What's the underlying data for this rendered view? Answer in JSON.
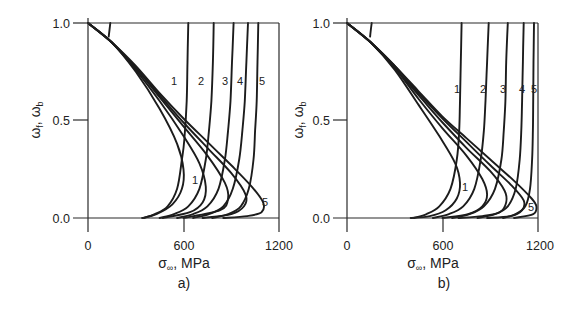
{
  "chart_data": [
    {
      "type": "line",
      "panel_label": "a)",
      "xlabel": "σ∞ , MPa",
      "xlabel_symbol": "σ",
      "xlabel_subscript": "∞",
      "xlabel_unit": ", MPa",
      "ylabel": "ωf , ωb",
      "ylabel_symbol_1": "ω",
      "ylabel_sub_1": "f",
      "ylabel_symbol_2": "ω",
      "ylabel_sub_2": "b",
      "xlim": [
        0,
        1200
      ],
      "ylim": [
        0.0,
        1.0
      ],
      "xticks": [
        "0",
        "600",
        "1200"
      ],
      "yticks": [
        "0.0",
        "0.5",
        "1.0"
      ],
      "grid": false,
      "legend": "none (curves numbered 1–5 inline)",
      "curve_labels_top": [
        "1",
        "2",
        "3",
        "4",
        "5"
      ],
      "curve_labels_bottom": [
        "1",
        "5"
      ],
      "series": [
        {
          "name": "1 (ωf branch)",
          "points": [
            [
              0,
              1.0
            ],
            [
              150,
              0.9
            ],
            [
              300,
              0.75
            ],
            [
              450,
              0.56
            ],
            [
              560,
              0.38
            ],
            [
              600,
              0.25
            ],
            [
              590,
              0.15
            ],
            [
              530,
              0.07
            ],
            [
              430,
              0.02
            ],
            [
              340,
              0.0
            ]
          ]
        },
        {
          "name": "2 (ωf branch)",
          "points": [
            [
              0,
              1.0
            ],
            [
              150,
              0.9
            ],
            [
              300,
              0.76
            ],
            [
              450,
              0.6
            ],
            [
              600,
              0.42
            ],
            [
              700,
              0.28
            ],
            [
              740,
              0.16
            ],
            [
              720,
              0.08
            ],
            [
              640,
              0.03
            ],
            [
              470,
              0.0
            ]
          ]
        },
        {
          "name": "3 (ωf branch)",
          "points": [
            [
              0,
              1.0
            ],
            [
              150,
              0.9
            ],
            [
              300,
              0.77
            ],
            [
              450,
              0.62
            ],
            [
              600,
              0.47
            ],
            [
              750,
              0.32
            ],
            [
              860,
              0.18
            ],
            [
              880,
              0.1
            ],
            [
              830,
              0.04
            ],
            [
              600,
              0.0
            ]
          ]
        },
        {
          "name": "4 (ωf branch)",
          "points": [
            [
              0,
              1.0
            ],
            [
              150,
              0.9
            ],
            [
              300,
              0.77
            ],
            [
              450,
              0.63
            ],
            [
              600,
              0.49
            ],
            [
              750,
              0.36
            ],
            [
              900,
              0.23
            ],
            [
              990,
              0.12
            ],
            [
              980,
              0.06
            ],
            [
              900,
              0.02
            ],
            [
              720,
              0.0
            ]
          ]
        },
        {
          "name": "5 (ωf branch)",
          "points": [
            [
              0,
              1.0
            ],
            [
              150,
              0.9
            ],
            [
              300,
              0.78
            ],
            [
              450,
              0.64
            ],
            [
              600,
              0.51
            ],
            [
              750,
              0.39
            ],
            [
              900,
              0.27
            ],
            [
              1030,
              0.16
            ],
            [
              1100,
              0.08
            ],
            [
              1090,
              0.03
            ],
            [
              1000,
              0.01
            ],
            [
              850,
              0.0
            ]
          ]
        },
        {
          "name": "1 (ωb branch)",
          "points": [
            [
              630,
              1.0
            ],
            [
              625,
              0.8
            ],
            [
              620,
              0.6
            ],
            [
              605,
              0.4
            ],
            [
              590,
              0.3
            ],
            [
              560,
              0.15
            ],
            [
              500,
              0.06
            ],
            [
              420,
              0.02
            ],
            [
              350,
              0.0
            ]
          ]
        },
        {
          "name": "2 (ωb branch)",
          "points": [
            [
              790,
              1.0
            ],
            [
              785,
              0.8
            ],
            [
              775,
              0.6
            ],
            [
              760,
              0.45
            ],
            [
              740,
              0.3
            ],
            [
              700,
              0.15
            ],
            [
              630,
              0.06
            ],
            [
              540,
              0.02
            ],
            [
              450,
              0.0
            ]
          ]
        },
        {
          "name": "3 (ωb branch)",
          "points": [
            [
              915,
              1.0
            ],
            [
              905,
              0.8
            ],
            [
              895,
              0.6
            ],
            [
              880,
              0.45
            ],
            [
              860,
              0.3
            ],
            [
              820,
              0.15
            ],
            [
              750,
              0.06
            ],
            [
              660,
              0.02
            ],
            [
              560,
              0.0
            ]
          ]
        },
        {
          "name": "4 (ωb branch)",
          "points": [
            [
              1005,
              1.0
            ],
            [
              995,
              0.8
            ],
            [
              985,
              0.6
            ],
            [
              970,
              0.45
            ],
            [
              950,
              0.3
            ],
            [
              910,
              0.15
            ],
            [
              850,
              0.06
            ],
            [
              760,
              0.02
            ],
            [
              660,
              0.0
            ]
          ]
        },
        {
          "name": "5 (ωb branch)",
          "points": [
            [
              1070,
              1.0
            ],
            [
              1065,
              0.8
            ],
            [
              1060,
              0.6
            ],
            [
              1050,
              0.45
            ],
            [
              1040,
              0.3
            ],
            [
              1010,
              0.15
            ],
            [
              960,
              0.06
            ],
            [
              880,
              0.02
            ],
            [
              780,
              0.0
            ]
          ]
        },
        {
          "name": "initial short branch",
          "points": [
            [
              140,
              1.0
            ],
            [
              130,
              0.93
            ]
          ]
        }
      ]
    },
    {
      "type": "line",
      "panel_label": "b)",
      "xlabel": "σ∞ , MPa",
      "xlabel_symbol": "σ",
      "xlabel_subscript": "∞",
      "xlabel_unit": ", MPa",
      "ylabel": "ωf , ωb",
      "ylabel_symbol_1": "ω",
      "ylabel_sub_1": "f",
      "ylabel_symbol_2": "ω",
      "ylabel_sub_2": "b",
      "xlim": [
        0,
        1200
      ],
      "ylim": [
        0.0,
        1.0
      ],
      "xticks": [
        "0",
        "600",
        "1200"
      ],
      "yticks": [
        "0.0",
        "0.5",
        "1.0"
      ],
      "grid": false,
      "legend": "none (curves numbered 1–5 inline)",
      "curve_labels_top": [
        "1",
        "2",
        "3",
        "4",
        "5"
      ],
      "curve_labels_bottom": [
        "1",
        "5"
      ],
      "series": [
        {
          "name": "1 (ωf branch)",
          "points": [
            [
              0,
              1.0
            ],
            [
              150,
              0.9
            ],
            [
              300,
              0.76
            ],
            [
              450,
              0.58
            ],
            [
              580,
              0.42
            ],
            [
              680,
              0.28
            ],
            [
              710,
              0.18
            ],
            [
              690,
              0.1
            ],
            [
              620,
              0.04
            ],
            [
              520,
              0.01
            ],
            [
              400,
              0.0
            ]
          ]
        },
        {
          "name": "2 (ωf branch)",
          "points": [
            [
              0,
              1.0
            ],
            [
              150,
              0.9
            ],
            [
              300,
              0.77
            ],
            [
              450,
              0.61
            ],
            [
              600,
              0.46
            ],
            [
              750,
              0.32
            ],
            [
              850,
              0.2
            ],
            [
              880,
              0.12
            ],
            [
              850,
              0.06
            ],
            [
              760,
              0.02
            ],
            [
              600,
              0.0
            ]
          ]
        },
        {
          "name": "3 (ωf branch)",
          "points": [
            [
              0,
              1.0
            ],
            [
              150,
              0.9
            ],
            [
              300,
              0.77
            ],
            [
              450,
              0.63
            ],
            [
              600,
              0.49
            ],
            [
              750,
              0.36
            ],
            [
              900,
              0.24
            ],
            [
              990,
              0.14
            ],
            [
              1000,
              0.08
            ],
            [
              960,
              0.03
            ],
            [
              850,
              0.01
            ],
            [
              700,
              0.0
            ]
          ]
        },
        {
          "name": "4 (ωf branch)",
          "points": [
            [
              0,
              1.0
            ],
            [
              150,
              0.9
            ],
            [
              300,
              0.78
            ],
            [
              450,
              0.64
            ],
            [
              600,
              0.51
            ],
            [
              750,
              0.39
            ],
            [
              900,
              0.27
            ],
            [
              1030,
              0.17
            ],
            [
              1110,
              0.09
            ],
            [
              1100,
              0.04
            ],
            [
              1030,
              0.01
            ],
            [
              880,
              0.0
            ]
          ]
        },
        {
          "name": "5 (ωf branch)",
          "points": [
            [
              0,
              1.0
            ],
            [
              150,
              0.9
            ],
            [
              300,
              0.78
            ],
            [
              450,
              0.65
            ],
            [
              600,
              0.52
            ],
            [
              750,
              0.41
            ],
            [
              900,
              0.3
            ],
            [
              1050,
              0.19
            ],
            [
              1160,
              0.1
            ],
            [
              1190,
              0.06
            ],
            [
              1170,
              0.02
            ],
            [
              1050,
              0.0
            ]
          ]
        },
        {
          "name": "1 (ωb branch)",
          "points": [
            [
              720,
              1.0
            ],
            [
              715,
              0.8
            ],
            [
              710,
              0.6
            ],
            [
              705,
              0.45
            ],
            [
              690,
              0.3
            ],
            [
              650,
              0.15
            ],
            [
              580,
              0.06
            ],
            [
              500,
              0.02
            ],
            [
              420,
              0.0
            ]
          ]
        },
        {
          "name": "2 (ωb branch)",
          "points": [
            [
              890,
              1.0
            ],
            [
              880,
              0.8
            ],
            [
              870,
              0.6
            ],
            [
              860,
              0.45
            ],
            [
              840,
              0.3
            ],
            [
              800,
              0.15
            ],
            [
              730,
              0.06
            ],
            [
              640,
              0.02
            ],
            [
              540,
              0.0
            ]
          ]
        },
        {
          "name": "3 (ωb branch)",
          "points": [
            [
              1010,
              1.0
            ],
            [
              1000,
              0.8
            ],
            [
              995,
              0.6
            ],
            [
              985,
              0.45
            ],
            [
              970,
              0.3
            ],
            [
              930,
              0.15
            ],
            [
              860,
              0.06
            ],
            [
              770,
              0.02
            ],
            [
              660,
              0.0
            ]
          ]
        },
        {
          "name": "4 (ωb branch)",
          "points": [
            [
              1110,
              1.0
            ],
            [
              1105,
              0.8
            ],
            [
              1100,
              0.6
            ],
            [
              1095,
              0.45
            ],
            [
              1085,
              0.3
            ],
            [
              1060,
              0.15
            ],
            [
              1010,
              0.06
            ],
            [
              930,
              0.02
            ],
            [
              820,
              0.0
            ]
          ]
        },
        {
          "name": "5 (ωb branch)",
          "points": [
            [
              1175,
              1.0
            ],
            [
              1172,
              0.8
            ],
            [
              1170,
              0.6
            ],
            [
              1168,
              0.45
            ],
            [
              1163,
              0.3
            ],
            [
              1150,
              0.15
            ],
            [
              1120,
              0.06
            ],
            [
              1060,
              0.02
            ],
            [
              980,
              0.0
            ]
          ]
        },
        {
          "name": "initial short branch",
          "points": [
            [
              155,
              1.0
            ],
            [
              145,
              0.93
            ]
          ]
        }
      ]
    }
  ],
  "panels": [
    {
      "id": "a",
      "label": "a)",
      "frame": {
        "x0": 88,
        "x1": 279,
        "y_top": 23,
        "y_bottom": 218
      },
      "label_positions": {
        "top": [
          [
            171,
            85
          ],
          [
            198,
            85
          ],
          [
            222,
            85
          ],
          [
            237,
            85
          ],
          [
            259,
            85
          ]
        ],
        "bottom": [
          [
            192,
            184
          ],
          [
            262,
            206
          ]
        ]
      }
    },
    {
      "id": "b",
      "label": "b)",
      "frame": {
        "x0": 347,
        "x1": 538,
        "y_top": 23,
        "y_bottom": 218
      },
      "label_positions": {
        "top": [
          [
            454,
            93
          ],
          [
            480,
            93
          ],
          [
            500,
            93
          ],
          [
            519,
            93
          ],
          [
            531,
            93
          ]
        ],
        "bottom": [
          [
            462,
            191
          ],
          [
            528,
            211
          ]
        ]
      }
    }
  ]
}
